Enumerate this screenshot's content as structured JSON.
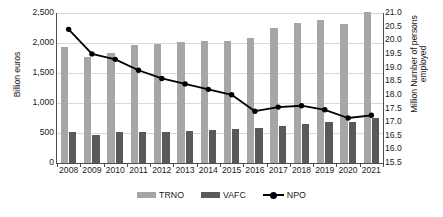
{
  "chart_data": {
    "type": "bar",
    "title": "",
    "xlabel": "",
    "ylabel": "Billion euros",
    "y2label_line1": "Million Number of persons",
    "y2label_line2": "employed",
    "grid": true,
    "legend_position": "bottom-center",
    "categories": [
      "2008",
      "2009",
      "2010",
      "2011",
      "2012",
      "2013",
      "2014",
      "2015",
      "2016",
      "2017",
      "2018",
      "2019",
      "2020",
      "2021"
    ],
    "ylim": [
      0,
      2500
    ],
    "yticks": [
      "0",
      "500",
      "1,000",
      "1,500",
      "2,000",
      "2,500"
    ],
    "ytick_values": [
      0,
      500,
      1000,
      1500,
      2000,
      2500
    ],
    "y2lim": [
      15.5,
      21.0
    ],
    "y2ticks": [
      "15.5",
      "16.0",
      "16.5",
      "17.0",
      "17.5",
      "18.0",
      "18.5",
      "19.0",
      "19.5",
      "20.0",
      "20.5",
      "21.0"
    ],
    "y2tick_values": [
      15.5,
      16.0,
      16.5,
      17.0,
      17.5,
      18.0,
      18.5,
      19.0,
      19.5,
      20.0,
      20.5,
      21.0
    ],
    "series": [
      {
        "name": "TRNO",
        "type": "bar",
        "axis": "left",
        "color": "#a6a6a6",
        "values": [
          1940,
          1760,
          1840,
          1960,
          1980,
          2020,
          2030,
          2040,
          2080,
          2250,
          2340,
          2390,
          2310,
          2520
        ]
      },
      {
        "name": "VAFC",
        "type": "bar",
        "axis": "left",
        "color": "#595959",
        "values": [
          515,
          475,
          515,
          525,
          525,
          530,
          545,
          560,
          585,
          615,
          650,
          690,
          680,
          755
        ]
      },
      {
        "name": "NPO",
        "type": "line",
        "axis": "right",
        "color": "#000000",
        "marker": "circle",
        "values": [
          20.4,
          19.5,
          19.3,
          18.9,
          18.6,
          18.4,
          18.2,
          18.0,
          17.4,
          17.55,
          17.6,
          17.45,
          17.15,
          17.25
        ]
      }
    ]
  },
  "legend": {
    "items": [
      {
        "label": "TRNO",
        "swatch": "bar-light"
      },
      {
        "label": "VAFC",
        "swatch": "bar-dark"
      },
      {
        "label": "NPO",
        "swatch": "line-marker"
      }
    ]
  }
}
